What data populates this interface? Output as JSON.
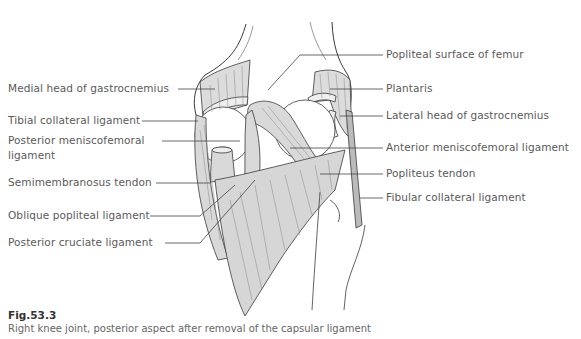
{
  "figure": {
    "number": "Fig.53.3",
    "caption": "Right knee joint, posterior aspect after removal of the capsular ligament"
  },
  "labels_left": [
    {
      "id": "medial-head-gastrocnemius",
      "text": "Medial head of gastrocnemius"
    },
    {
      "id": "tibial-collateral-ligament",
      "text": "Tibial collateral ligament"
    },
    {
      "id": "posterior-meniscofemoral-ligament-1",
      "text": "Posterior meniscofemoral"
    },
    {
      "id": "posterior-meniscofemoral-ligament-2",
      "text": "ligament"
    },
    {
      "id": "semimembranosus-tendon",
      "text": "Semimembranosus tendon"
    },
    {
      "id": "oblique-popliteal-ligament",
      "text": "Oblique popliteal ligament"
    },
    {
      "id": "posterior-cruciate-ligament",
      "text": "Posterior cruciate ligament"
    }
  ],
  "labels_right": [
    {
      "id": "popliteal-surface-femur",
      "text": "Popliteal surface of femur"
    },
    {
      "id": "plantaris",
      "text": "Plantaris"
    },
    {
      "id": "lateral-head-gastrocnemius",
      "text": "Lateral head of gastrocnemius"
    },
    {
      "id": "anterior-meniscofemoral-ligament",
      "text": "Anterior meniscofemoral ligament"
    },
    {
      "id": "popliteus-tendon",
      "text": "Popliteus tendon"
    },
    {
      "id": "fibular-collateral-ligament",
      "text": "Fibular collateral ligament"
    }
  ],
  "colors": {
    "outline": "#3a3a3a",
    "fill_gray": "#d9d9d9",
    "label_text": "#5a5a5a",
    "leader_line": "#444444"
  }
}
